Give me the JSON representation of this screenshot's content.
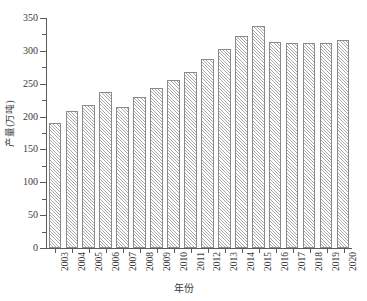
{
  "chart_data": {
    "type": "bar",
    "title": "",
    "xlabel": "年份",
    "ylabel": "产量(万吨)",
    "categories": [
      "2003",
      "2004",
      "2005",
      "2006",
      "2007",
      "2008",
      "2009",
      "2010",
      "2011",
      "2012",
      "2013",
      "2014",
      "2015",
      "2016",
      "2017",
      "2018",
      "2019",
      "2020"
    ],
    "values": [
      190,
      208,
      218,
      238,
      214,
      230,
      244,
      256,
      268,
      287,
      303,
      322,
      338,
      314,
      312,
      312,
      312,
      316
    ],
    "series": [
      {
        "name": "产量",
        "values": [
          190,
          208,
          218,
          238,
          214,
          230,
          244,
          256,
          268,
          287,
          303,
          322,
          338,
          314,
          312,
          312,
          312,
          316
        ]
      }
    ],
    "ylim": [
      0,
      350
    ],
    "y_major_ticks": [
      0,
      50,
      100,
      150,
      200,
      250,
      300,
      350
    ],
    "y_major_tick_labels": [
      "0",
      "50",
      "100",
      "150",
      "200",
      "250",
      "300",
      "350"
    ],
    "y_minor_ticks": [
      25,
      75,
      125,
      175,
      225,
      275,
      325
    ],
    "grid": false,
    "legend": "none",
    "bar_style": {
      "fill": "#ffffff",
      "hatch": "diagonal-45",
      "hatch_color": "#a8a8a8",
      "edge_color": "#8a8a8a"
    },
    "axis_color": "#5a5a5a",
    "text_color": "#3a3a3a",
    "background": "#ffffff"
  }
}
